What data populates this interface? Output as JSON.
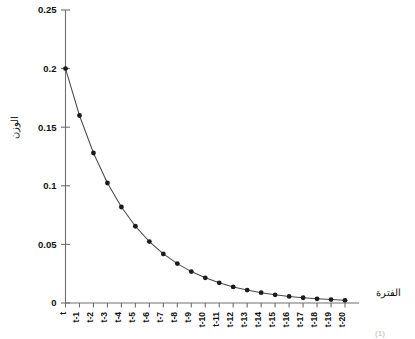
{
  "chart_data": {
    "type": "line",
    "title": "",
    "subtitle": "",
    "xlabel": "الفترة",
    "ylabel": "الوزن",
    "categories": [
      "t",
      "t-1",
      "t-2",
      "t-3",
      "t-4",
      "t-5",
      "t-6",
      "t-7",
      "t-8",
      "t-9",
      "t-10",
      "t-11",
      "t-12",
      "t-13",
      "t-14",
      "t-15",
      "t-16",
      "t-17",
      "t-18",
      "t-19",
      "t-20"
    ],
    "values": [
      0.2,
      0.16,
      0.128,
      0.1024,
      0.0819,
      0.0655,
      0.0524,
      0.0419,
      0.0336,
      0.0268,
      0.0215,
      0.0172,
      0.0137,
      0.011,
      0.0088,
      0.007,
      0.0056,
      0.0045,
      0.0036,
      0.0029,
      0.0023
    ],
    "ylim": [
      0,
      0.25
    ],
    "ytick_labels": [
      "0",
      "0.05",
      "0.1",
      "0.15",
      "0.2",
      "0.25"
    ],
    "ytick_values": [
      0,
      0.05,
      0.1,
      0.15,
      0.2,
      0.25
    ],
    "grid": false,
    "legend": null,
    "legend_position": "none",
    "marker": "filled-circle",
    "line_color": "#4a4a4a",
    "marker_color": "#1b1b1b",
    "axis_color": "#6f6f6f",
    "background_color": "#ffffff"
  },
  "labels": {
    "y_axis_title": "الوزن",
    "x_axis_title": "الفترة",
    "bottom_caption": "(1)"
  }
}
